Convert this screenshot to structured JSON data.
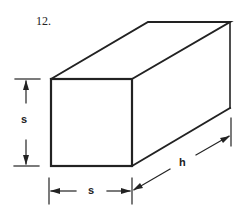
{
  "problem_number": "12.",
  "figure": {
    "type": "rectangular prism (square cross-section)",
    "labels": {
      "height": "s",
      "width": "s",
      "length": "h"
    },
    "stroke_color": "#222222"
  }
}
